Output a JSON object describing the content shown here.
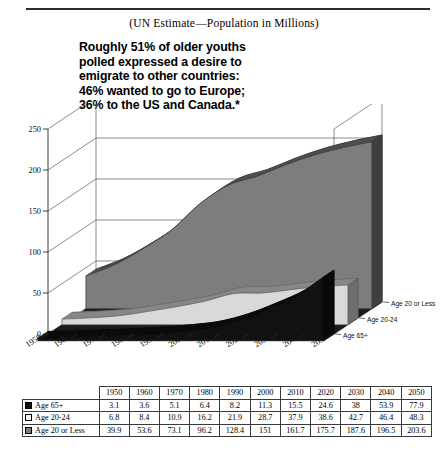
{
  "header": {
    "subtitle": "(UN Estimate—Population in Millions)"
  },
  "callout": {
    "line1": "Roughly 51% of older youths",
    "line2": "polled expressed a desire to",
    "line3": "emigrate to other countries:",
    "line4": "46% wanted to go to Europe;",
    "line5": "36% to the US and Canada.*"
  },
  "legend": {
    "items": [
      {
        "label": "Age 20 or Less",
        "color": "#7d7d7d"
      },
      {
        "label": "Age  20-24",
        "color": "#d9d9d9"
      },
      {
        "label": "Age 65+",
        "color": "#111111"
      }
    ]
  },
  "axis": {
    "y_ticks": [
      "0",
      "50",
      "100",
      "150",
      "200",
      "250"
    ],
    "x_ticks": [
      "1950",
      "1960",
      "1970",
      "1980",
      "1990",
      "2000",
      "2010",
      "2020",
      "2030",
      "2040",
      "2050"
    ]
  },
  "table": {
    "columns": [
      "1950",
      "1960",
      "1970",
      "1980",
      "1990",
      "2000",
      "2010",
      "2020",
      "2030",
      "2040",
      "2050"
    ],
    "rows": [
      {
        "label": "Age 65+",
        "swatch": "black",
        "values": [
          "3.1",
          "3.6",
          "5.1",
          "6.4",
          "8.2",
          "11.3",
          "15.5",
          "24.6",
          "38",
          "53.9",
          "77.9"
        ]
      },
      {
        "label": "Age  20-24",
        "swatch": "white",
        "values": [
          "6.8",
          "8.4",
          "10.9",
          "16.2",
          "21.9",
          "28.7",
          "37.9",
          "38.6",
          "42.7",
          "46.4",
          "48.3"
        ]
      },
      {
        "label": "Age 20 or Less",
        "swatch": "gray",
        "values": [
          "39.9",
          "53.6",
          "73.1",
          "96.2",
          "128.4",
          "151",
          "161.7",
          "175.7",
          "187.6",
          "196.5",
          "203.6"
        ]
      }
    ]
  },
  "chart_data": {
    "type": "area",
    "title": "",
    "subtitle": "(UN Estimate—Population in Millions)",
    "xlabel": "",
    "ylabel": "",
    "ylim": [
      0,
      250
    ],
    "grid": true,
    "legend_position": "right",
    "categories": [
      "1950",
      "1960",
      "1970",
      "1980",
      "1990",
      "2000",
      "2010",
      "2020",
      "2030",
      "2040",
      "2050"
    ],
    "series": [
      {
        "name": "Age 20 or Less",
        "color": "#7d7d7d",
        "values": [
          39.9,
          53.6,
          73.1,
          96.2,
          128.4,
          151,
          161.7,
          175.7,
          187.6,
          196.5,
          203.6
        ]
      },
      {
        "name": "Age  20-24",
        "color": "#d9d9d9",
        "values": [
          6.8,
          8.4,
          10.9,
          16.2,
          21.9,
          28.7,
          37.9,
          38.6,
          42.7,
          46.4,
          48.3
        ]
      },
      {
        "name": "Age 65+",
        "color": "#111111",
        "values": [
          3.1,
          3.6,
          5.1,
          6.4,
          8.2,
          11.3,
          15.5,
          24.6,
          38,
          53.9,
          77.9
        ]
      }
    ],
    "annotation": "Roughly 51% of older youths polled expressed a desire to emigrate to other countries: 46% wanted to go to Europe; 36% to the US and Canada."
  }
}
